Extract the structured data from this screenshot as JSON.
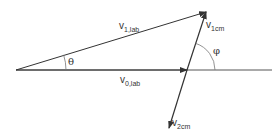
{
  "diagram": {
    "colors": {
      "line": "#333333",
      "background": "#ffffff"
    },
    "points": {
      "origin": [
        16,
        70
      ],
      "v0_tip": [
        187,
        70
      ],
      "v1lab_tip": [
        206,
        12
      ],
      "v2cm_tip": [
        169,
        128
      ],
      "axis_end": [
        272,
        70
      ]
    },
    "vectors": [
      {
        "name": "v0,lab",
        "from": "origin",
        "to": "v0_tip"
      },
      {
        "name": "v1,lab",
        "from": "origin",
        "to": "v1lab_tip"
      },
      {
        "name": "v1cm",
        "from": "v0_tip",
        "to": "v1lab_tip"
      },
      {
        "name": "v2cm",
        "from": "v0_tip",
        "to": "v2cm_tip"
      }
    ],
    "angles": [
      {
        "symbol": "θ",
        "between": [
          "v0,lab",
          "v1,lab"
        ]
      },
      {
        "symbol": "φ",
        "between": [
          "horizontal axis",
          "v1cm"
        ]
      }
    ],
    "labels": {
      "v1lab": {
        "main": "v",
        "sub": "1,lab"
      },
      "v0lab": {
        "main": "v",
        "sub": "0,lab"
      },
      "v1cm": {
        "main": "v",
        "sub": "1cm"
      },
      "v2cm": {
        "main": "v",
        "sub": "2cm"
      },
      "theta": "θ",
      "phi": "φ"
    }
  }
}
